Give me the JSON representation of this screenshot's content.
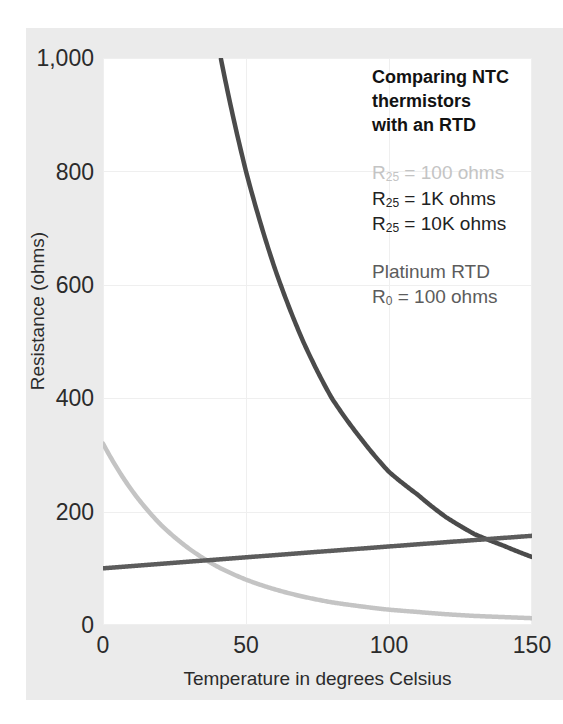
{
  "chart_data": {
    "type": "line",
    "title": "Comparing NTC thermistors with an RTD",
    "xlabel": "Temperature in degrees Celsius",
    "ylabel": "Resistance (ohms)",
    "xlim": [
      0,
      150
    ],
    "ylim": [
      0,
      1000
    ],
    "xticks": [
      "0",
      "50",
      "100",
      "150"
    ],
    "yticks": [
      "0",
      "200",
      "400",
      "600",
      "800",
      "1,000"
    ],
    "grid": true,
    "legend_position": "top-right-inside",
    "x": [
      0,
      10,
      20,
      25,
      30,
      40,
      50,
      60,
      70,
      80,
      90,
      100,
      110,
      120,
      130,
      140,
      150
    ],
    "series": [
      {
        "name": "R25 = 100 ohms",
        "label": "R<sub>25</sub> = 100 ohms",
        "color": "#c4c4c4",
        "values": [
          320,
          238,
          178,
          155,
          135,
          103,
          80,
          63,
          50,
          40,
          33,
          27,
          23,
          19,
          16,
          14,
          12
        ]
      },
      {
        "name": "R25 = 1K ohms",
        "label": "R<sub>25</sub> = 1K ohms",
        "color": "#4b4b4b",
        "values": [
          3200,
          2380,
          1780,
          1550,
          1350,
          1030,
          800,
          630,
          500,
          400,
          330,
          270,
          230,
          190,
          160,
          140,
          120
        ]
      },
      {
        "name": "R25 = 10K ohms",
        "label": "R<sub>25</sub> = 10K ohms",
        "color": "#4b4b4b",
        "values": [
          32000,
          23800,
          17800,
          15500,
          13500,
          10300,
          8000,
          6300,
          5000,
          4000,
          3300,
          2700,
          2300,
          1900,
          1600,
          1400,
          1200
        ]
      },
      {
        "name": "Platinum RTD R0 = 100 ohms",
        "label": "Platinum RTD",
        "color": "#5c5c5c",
        "values": [
          100,
          103.9,
          107.8,
          109.7,
          111.7,
          115.5,
          119.4,
          123.2,
          127.1,
          130.9,
          134.7,
          138.5,
          142.3,
          146.1,
          149.8,
          153.6,
          157.3
        ]
      }
    ]
  },
  "legend": {
    "title_lines": [
      "Comparing NTC",
      "thermistors",
      "with an RTD"
    ],
    "ntc_entries": [
      {
        "prefix": "R",
        "sub": "25",
        "rest": " = 100 ohms",
        "tone": "c-light"
      },
      {
        "prefix": "R",
        "sub": "25",
        "rest": " = 1K ohms",
        "tone": "c-dark"
      },
      {
        "prefix": "R",
        "sub": "25",
        "rest": " = 10K ohms",
        "tone": "c-dark"
      }
    ],
    "rtd_name": "Platinum RTD",
    "rtd_prefix": "R",
    "rtd_sub": "0",
    "rtd_rest": " = 100 ohms"
  },
  "axes": {
    "ylabel": "Resistance (ohms)",
    "xlabel": "Temperature in degrees Celsius",
    "yticks": [
      "1,000",
      "800",
      "600",
      "400",
      "200",
      "0"
    ],
    "xticks": [
      "0",
      "50",
      "100",
      "150"
    ]
  },
  "colors": {
    "panel_bg": "#ebebeb",
    "plot_bg": "#ffffff",
    "grid": "#efefef",
    "curve_light": "#c4c4c4",
    "curve_dark": "#4b4b4b",
    "curve_rtd": "#5c5c5c",
    "text": "#2b2b2b"
  }
}
